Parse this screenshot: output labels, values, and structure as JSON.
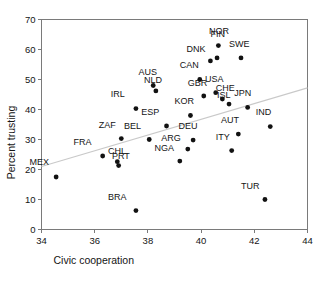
{
  "chart_data": {
    "type": "scatter",
    "title": "",
    "xlabel": "Civic cooperation",
    "ylabel": "Percent trusting",
    "xlim": [
      34,
      44
    ],
    "ylim": [
      0,
      70
    ],
    "xticks": [
      34,
      36,
      38,
      40,
      42,
      44
    ],
    "yticks": [
      0,
      10,
      20,
      30,
      40,
      50,
      60,
      70
    ],
    "grid": false,
    "legend": null,
    "trend_line": {
      "label": "fitted regression line",
      "x": [
        34,
        44
      ],
      "y": [
        21.0,
        47.2
      ],
      "color": "#c9c9c9"
    },
    "marker_color": "#121212",
    "points": [
      {
        "label": "MEX",
        "x": 34.55,
        "y": 17.5,
        "label_dx": -1.0,
        "label_dy": 5.0
      },
      {
        "label": "FRA",
        "x": 36.3,
        "y": 24.5,
        "label_dx": -1.1,
        "label_dy": 4.6
      },
      {
        "label": "ZAF",
        "x": 37.0,
        "y": 30.3,
        "label_dx": -0.85,
        "label_dy": 4.6
      },
      {
        "label": "CHL",
        "x": 36.85,
        "y": 22.6,
        "label_dx": -0.35,
        "label_dy": 3.6
      },
      {
        "label": "PRT",
        "x": 36.9,
        "y": 21.3,
        "label_dx": -0.25,
        "label_dy": 3.1
      },
      {
        "label": "BRA",
        "x": 37.55,
        "y": 6.3,
        "label_dx": -1.05,
        "label_dy": 4.7
      },
      {
        "label": "IRL",
        "x": 37.55,
        "y": 40.3,
        "label_dx": -0.95,
        "label_dy": 4.8
      },
      {
        "label": "BEL",
        "x": 38.05,
        "y": 30.0,
        "label_dx": -0.95,
        "label_dy": 4.6
      },
      {
        "label": "AUS",
        "x": 38.2,
        "y": 48.0,
        "label_dx": -0.55,
        "label_dy": 4.6
      },
      {
        "label": "NLD",
        "x": 38.3,
        "y": 46.2,
        "label_dx": -0.45,
        "label_dy": 3.5
      },
      {
        "label": "ESP",
        "x": 38.7,
        "y": 34.5,
        "label_dx": -0.95,
        "label_dy": 4.6
      },
      {
        "label": "NGA",
        "x": 39.2,
        "y": 22.8,
        "label_dx": -0.95,
        "label_dy": 4.5
      },
      {
        "label": "ARG",
        "x": 39.5,
        "y": 26.8,
        "label_dx": -1.0,
        "label_dy": 3.6
      },
      {
        "label": "DEU",
        "x": 39.7,
        "y": 29.8,
        "label_dx": -0.55,
        "label_dy": 4.7
      },
      {
        "label": "KOR",
        "x": 39.6,
        "y": 38.0,
        "label_dx": -0.6,
        "label_dy": 4.8
      },
      {
        "label": "CAN",
        "x": 39.95,
        "y": 50.0,
        "label_dx": -0.75,
        "label_dy": 4.8
      },
      {
        "label": "GBR",
        "x": 40.1,
        "y": 44.5,
        "label_dx": -0.6,
        "label_dy": 4.5
      },
      {
        "label": "DNK",
        "x": 40.35,
        "y": 56.2,
        "label_dx": -0.9,
        "label_dy": 4.0
      },
      {
        "label": "USA",
        "x": 40.55,
        "y": 45.6,
        "label_dx": -0.4,
        "label_dy": 4.7
      },
      {
        "label": "FIN",
        "x": 40.65,
        "y": 61.3,
        "label_dx": -0.3,
        "label_dy": 3.8
      },
      {
        "label": "NOR",
        "x": 40.6,
        "y": 57.2,
        "label_dx": -0.3,
        "label_dy": 9.0
      },
      {
        "label": "CHE",
        "x": 40.8,
        "y": 43.5,
        "label_dx": -0.25,
        "label_dy": 3.6
      },
      {
        "label": "ISL",
        "x": 41.05,
        "y": 41.8,
        "label_dx": -0.45,
        "label_dy": 2.9
      },
      {
        "label": "ITY",
        "x": 41.15,
        "y": 26.3,
        "label_dx": -0.6,
        "label_dy": 4.6
      },
      {
        "label": "AUT",
        "x": 41.4,
        "y": 31.8,
        "label_dx": -0.65,
        "label_dy": 4.6
      },
      {
        "label": "SWE",
        "x": 41.5,
        "y": 57.2,
        "label_dx": -0.45,
        "label_dy": 4.8
      },
      {
        "label": "JPN",
        "x": 41.75,
        "y": 40.7,
        "label_dx": -0.5,
        "label_dy": 4.7
      },
      {
        "label": "TUR",
        "x": 42.4,
        "y": 10.0,
        "label_dx": -0.9,
        "label_dy": 4.6
      },
      {
        "label": "IND",
        "x": 42.6,
        "y": 34.3,
        "label_dx": -0.55,
        "label_dy": 4.8
      }
    ]
  },
  "axes": {
    "x_title": "Civic cooperation",
    "y_title": "Percent trusting",
    "x_tick_labels": [
      "34",
      "36",
      "38",
      "40",
      "42",
      "44"
    ],
    "y_tick_labels": [
      "0",
      "10",
      "20",
      "30",
      "40",
      "50",
      "60",
      "70"
    ]
  }
}
